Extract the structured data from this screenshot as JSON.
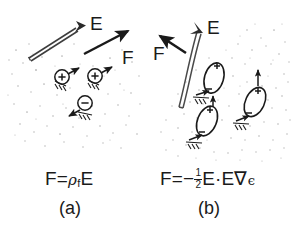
{
  "figure": {
    "type": "scientific-diagram",
    "background_color": "#ffffff",
    "ink_color": "#1a1a1a",
    "speckle_color": "#b9b9b9",
    "width": 293,
    "height": 229
  },
  "panel_a": {
    "id": "a",
    "label": "(a)",
    "field_label": "E",
    "force_label": "F",
    "formula": {
      "lhs": "F",
      "equals": "=",
      "rho": "ρ",
      "rho_subscript": "f",
      "field": "E",
      "plain_text": "F = ρf E"
    },
    "particles": [
      {
        "sign": "+",
        "name": "positive-charge-1"
      },
      {
        "sign": "+",
        "name": "positive-charge-2"
      },
      {
        "sign": "−",
        "name": "negative-charge-1"
      }
    ],
    "field_type": "uniform",
    "e_arrow_style": "double-line",
    "f_arrow_style": "solid"
  },
  "panel_b": {
    "id": "b",
    "label": "(b)",
    "field_label": "E",
    "force_label": "F",
    "formula": {
      "lhs": "F",
      "equals": "=",
      "minus": "−",
      "frac_num": "1",
      "frac_den": "2",
      "field": "E",
      "dot": "·",
      "grad": "∇",
      "epsilon": "ϵ",
      "plain_text": "F = −½E·E∇ϵ"
    },
    "particles": [
      {
        "sign_top": "+",
        "sign_bottom": "−",
        "name": "induced-dipole-1"
      },
      {
        "sign_top": "+",
        "sign_bottom": "−",
        "name": "induced-dipole-2"
      },
      {
        "sign_top": "+",
        "sign_bottom": "−",
        "name": "induced-dipole-3"
      }
    ],
    "field_type": "non-uniform",
    "e_arrow_style": "double-line-curved",
    "f_arrow_style": "solid"
  }
}
